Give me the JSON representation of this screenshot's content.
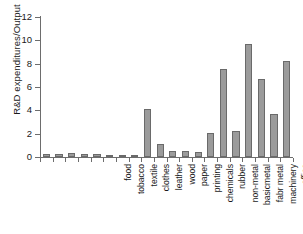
{
  "chart_data": {
    "type": "bar",
    "title": "",
    "xlabel": "",
    "ylabel": "R&D expenditures/Output",
    "ylim": [
      0,
      12
    ],
    "yticks": [
      0,
      2,
      4,
      6,
      8,
      10,
      12
    ],
    "grid": false,
    "legend": null,
    "bar_color": "#9b9b9b",
    "bar_border_color": "#6a6a6a",
    "axis_color": "#6d6d6d",
    "categories": [
      "food",
      "tobacco",
      "textile",
      "clothes",
      "leather",
      "wood",
      "paper",
      "printing",
      "chemicals",
      "rubber",
      "non-metal",
      "basicmetal",
      "fabr metal",
      "machinery",
      "office",
      "electrical",
      "radio and tv",
      "medical",
      "transport",
      "other"
    ],
    "values": [
      0.28,
      0.25,
      0.35,
      0.3,
      0.3,
      0.07,
      0.17,
      0.06,
      4.15,
      1.1,
      0.55,
      0.55,
      0.4,
      2.05,
      7.55,
      2.2,
      9.65,
      6.7,
      3.65,
      8.2
    ]
  }
}
